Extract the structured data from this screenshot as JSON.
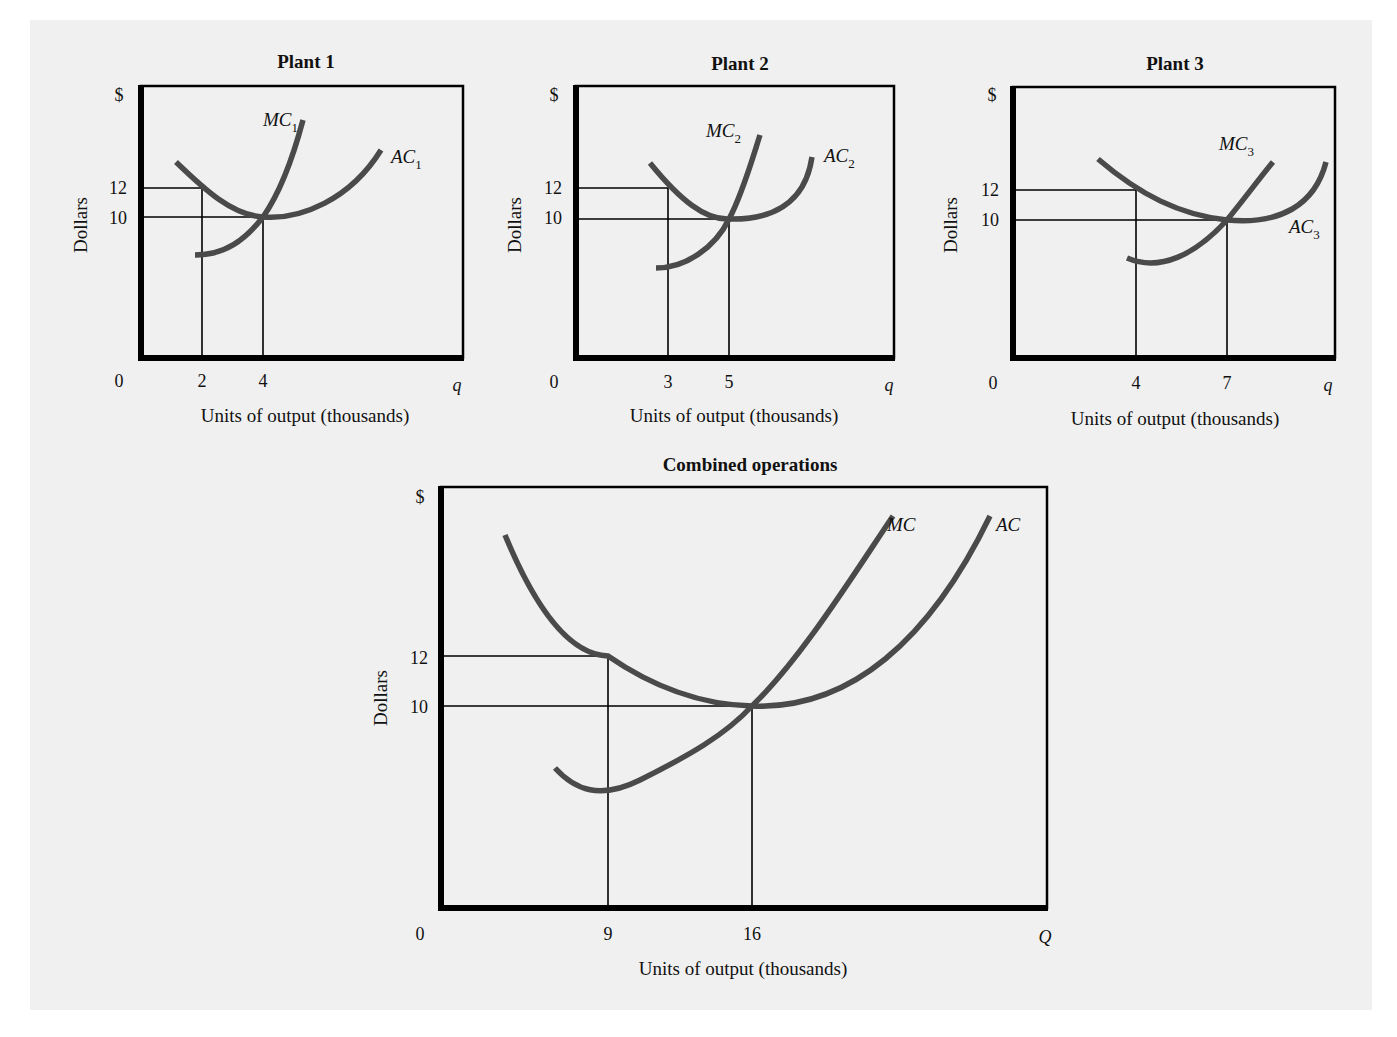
{
  "colors": {
    "background": "#f0f0f0",
    "page_outer": "#ffffff",
    "axis": "#000000",
    "curve": "#4a4a4a",
    "text": "#111111"
  },
  "chart_data": [
    {
      "id": "plant1",
      "type": "line",
      "title": "Plant 1",
      "xlabel": "Units of output (thousands)",
      "ylabel": "Dollars",
      "y_unit_label": "$",
      "x_var_label": "q",
      "origin_label": "0",
      "x_ticks": [
        {
          "label": "2",
          "value": 2
        },
        {
          "label": "4",
          "value": 4
        }
      ],
      "y_ticks": [
        {
          "label": "12",
          "value": 12
        },
        {
          "label": "10",
          "value": 10
        }
      ],
      "grid": false,
      "series": [
        {
          "name": "MC",
          "subscript": "1",
          "shape": "upward-sloping convex",
          "points": [
            [
              1.5,
              7.7
            ],
            [
              2.5,
              8.1
            ],
            [
              3.5,
              9.2
            ],
            [
              4,
              10
            ],
            [
              4.8,
              12.6
            ],
            [
              5.7,
              16.0
            ]
          ]
        },
        {
          "name": "AC",
          "subscript": "1",
          "shape": "U-shaped",
          "points": [
            [
              1.2,
              13.0
            ],
            [
              2,
              12
            ],
            [
              3,
              10.5
            ],
            [
              4,
              10
            ],
            [
              5,
              10.3
            ],
            [
              6.2,
              12.4
            ],
            [
              7.2,
              14.3
            ]
          ]
        }
      ],
      "annotations": [
        {
          "text": "At q=2, AC=12"
        },
        {
          "text": "At q=4, MC=AC=10 (minimum AC)"
        }
      ]
    },
    {
      "id": "plant2",
      "type": "line",
      "title": "Plant 2",
      "xlabel": "Units of output (thousands)",
      "ylabel": "Dollars",
      "y_unit_label": "$",
      "x_var_label": "q",
      "origin_label": "0",
      "x_ticks": [
        {
          "label": "3",
          "value": 3
        },
        {
          "label": "5",
          "value": 5
        }
      ],
      "y_ticks": [
        {
          "label": "12",
          "value": 12
        },
        {
          "label": "10",
          "value": 10
        }
      ],
      "grid": false,
      "series": [
        {
          "name": "MC",
          "subscript": "2",
          "shape": "upward-sloping convex",
          "points": [
            [
              2.8,
              7.3
            ],
            [
              3.5,
              7.7
            ],
            [
              4.5,
              8.8
            ],
            [
              5,
              10
            ],
            [
              5.5,
              13
            ],
            [
              6.0,
              16.3
            ]
          ]
        },
        {
          "name": "AC",
          "subscript": "2",
          "shape": "U-shaped",
          "points": [
            [
              2.5,
              13.0
            ],
            [
              3,
              12
            ],
            [
              4,
              10.5
            ],
            [
              5,
              10
            ],
            [
              6,
              10.4
            ],
            [
              7,
              12.3
            ],
            [
              7.6,
              13.9
            ]
          ]
        }
      ],
      "annotations": [
        {
          "text": "At q=3, AC=12"
        },
        {
          "text": "At q=5, MC=AC=10 (minimum AC)"
        }
      ]
    },
    {
      "id": "plant3",
      "type": "line",
      "title": "Plant 3",
      "xlabel": "Units of output (thousands)",
      "ylabel": "Dollars",
      "y_unit_label": "$",
      "x_var_label": "q",
      "origin_label": "0",
      "x_ticks": [
        {
          "label": "4",
          "value": 4
        },
        {
          "label": "7",
          "value": 7
        }
      ],
      "y_ticks": [
        {
          "label": "12",
          "value": 12
        },
        {
          "label": "10",
          "value": 10
        }
      ],
      "grid": false,
      "series": [
        {
          "name": "MC",
          "subscript": "3",
          "shape": "upward-sloping convex",
          "points": [
            [
              3.9,
              8.0
            ],
            [
              5,
              7.7
            ],
            [
              6,
              8.5
            ],
            [
              7,
              10
            ],
            [
              8,
              13.3
            ],
            [
              8.5,
              14.7
            ]
          ]
        },
        {
          "name": "AC",
          "subscript": "3",
          "shape": "U-shaped",
          "points": [
            [
              2.7,
              13.4
            ],
            [
              4,
              12
            ],
            [
              5.5,
              10.6
            ],
            [
              7,
              10
            ],
            [
              8,
              10.2
            ],
            [
              9,
              12.3
            ],
            [
              9.6,
              14.6
            ]
          ]
        }
      ],
      "annotations": [
        {
          "text": "At q=4, AC=12"
        },
        {
          "text": "At q=7, MC=AC=10 (minimum AC)"
        }
      ]
    },
    {
      "id": "combined",
      "type": "line",
      "title": "Combined operations",
      "xlabel": "Units of output (thousands)",
      "ylabel": "Dollars",
      "y_unit_label": "$",
      "x_var_label": "Q",
      "origin_label": "0",
      "x_ticks": [
        {
          "label": "9",
          "value": 9
        },
        {
          "label": "16",
          "value": 16
        }
      ],
      "y_ticks": [
        {
          "label": "12",
          "value": 12
        },
        {
          "label": "10",
          "value": 10
        }
      ],
      "grid": false,
      "series": [
        {
          "name": "MC",
          "subscript": "",
          "shape": "U-shaped with minimum near Q=9, rising steeply",
          "points": [
            [
              5.5,
              8.6
            ],
            [
              7,
              7.8
            ],
            [
              9,
              7.7
            ],
            [
              12,
              8.6
            ],
            [
              16,
              10
            ],
            [
              19,
              13.5
            ],
            [
              22.5,
              19.2
            ]
          ]
        },
        {
          "name": "AC",
          "subscript": "",
          "shape": "U-shaped",
          "points": [
            [
              3,
              17.2
            ],
            [
              6,
              13.7
            ],
            [
              9,
              12
            ],
            [
              12,
              10.8
            ],
            [
              16,
              10
            ],
            [
              19.5,
              10.8
            ],
            [
              25,
              15.5
            ],
            [
              27.5,
              19.3
            ]
          ]
        }
      ],
      "annotations": [
        {
          "text": "At Q=9, AC=12"
        },
        {
          "text": "At Q=16, MC=AC=10 (minimum AC)"
        }
      ]
    }
  ],
  "layout": {
    "panels": [
      {
        "id": "plant1",
        "frame": {
          "l": 141,
          "t": 86,
          "r": 463,
          "b": 358
        },
        "y_px": {
          "12": 188,
          "10": 217
        },
        "x_px": {
          "2": 202,
          "4": 263
        },
        "title_xy": [
          306,
          68
        ],
        "dollar_xy": [
          119,
          101
        ],
        "ylabel_xy": [
          87,
          225
        ],
        "tick12_xy": [
          127,
          194
        ],
        "tick10_xy": [
          127,
          224
        ],
        "zero_xy": [
          119,
          387
        ],
        "xtick_y": 387,
        "q_xy": [
          457,
          391
        ],
        "xlabel_xy": [
          305,
          422
        ],
        "mc_path": "M195,255 C225,255 245,240 263,217 C282,190 295,150 303,120",
        "ac_path": "M176,162 C205,190 232,215 263,217 C300,220 350,200 381,150",
        "mc_label_xy": [
          263,
          126
        ],
        "ac_label_xy": [
          391,
          163
        ]
      },
      {
        "id": "plant2",
        "frame": {
          "l": 576,
          "t": 86,
          "r": 894,
          "b": 358
        },
        "y_px": {
          "12": 188,
          "10": 219
        },
        "x_px": {
          "3": 668,
          "5": 729
        },
        "title_xy": [
          740,
          70
        ],
        "dollar_xy": [
          554,
          101
        ],
        "ylabel_xy": [
          521,
          225
        ],
        "tick12_xy": [
          562,
          194
        ],
        "tick10_xy": [
          562,
          224
        ],
        "zero_xy": [
          554,
          388
        ],
        "xtick_y": 388,
        "q_xy": [
          889,
          391
        ],
        "xlabel_xy": [
          734,
          422
        ],
        "mc_path": "M656,268 C685,268 715,248 729,219 C742,195 752,160 760,135",
        "ac_path": "M650,163 C680,200 705,220 729,219 C770,220 805,205 812,157",
        "mc_label_xy": [
          706,
          137
        ],
        "ac_label_xy": [
          824,
          162
        ]
      },
      {
        "id": "plant3",
        "frame": {
          "l": 1013,
          "t": 87,
          "r": 1335,
          "b": 358
        },
        "y_px": {
          "12": 190,
          "10": 220
        },
        "x_px": {
          "4": 1136,
          "7": 1227
        },
        "title_xy": [
          1175,
          70
        ],
        "dollar_xy": [
          992,
          101
        ],
        "ylabel_xy": [
          957,
          225
        ],
        "tick12_xy": [
          999,
          196
        ],
        "tick10_xy": [
          999,
          226
        ],
        "zero_xy": [
          993,
          389
        ],
        "xtick_y": 389,
        "q_xy": [
          1328,
          391
        ],
        "xlabel_xy": [
          1175,
          425
        ],
        "mc_path": "M1127,258 C1160,272 1195,255 1227,220 C1245,198 1262,175 1273,162",
        "ac_path": "M1098,159 C1140,195 1180,215 1227,220 C1280,225 1315,205 1326,162",
        "mc_label_xy": [
          1219,
          150
        ],
        "ac_label_xy": [
          1289,
          233
        ]
      },
      {
        "id": "combined",
        "frame": {
          "l": 441,
          "t": 487,
          "r": 1047,
          "b": 908
        },
        "y_px": {
          "12": 656,
          "10": 706
        },
        "x_px": {
          "9": 608,
          "16": 752
        },
        "title_xy": [
          750,
          471
        ],
        "dollar_xy": [
          420,
          503
        ],
        "ylabel_xy": [
          387,
          698
        ],
        "tick12_xy": [
          428,
          664
        ],
        "tick10_xy": [
          428,
          713
        ],
        "zero_xy": [
          420,
          940
        ],
        "xtick_y": 940,
        "q_xy": [
          1045,
          943
        ],
        "xlabel_xy": [
          743,
          975
        ],
        "mc_path": "M555,768 C575,790 600,800 640,780 C690,755 725,735 752,706 C800,660 850,580 893,516",
        "ac_path": "M505,535 C540,620 575,655 608,656 C650,685 700,705 752,706 C850,710 930,640 990,516",
        "mc_label_xy": [
          887,
          531
        ],
        "ac_label_xy": [
          996,
          531
        ]
      }
    ]
  }
}
